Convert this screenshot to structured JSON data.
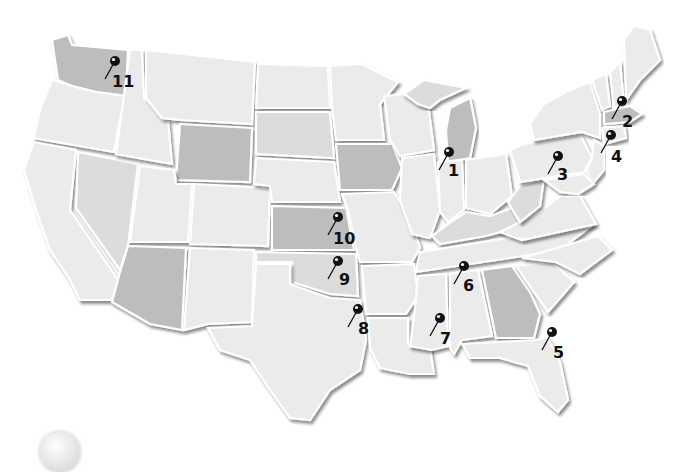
{
  "map": {
    "title": "United States map with numbered location pins",
    "style": "grayscale embossed states",
    "colors": {
      "background": "#ffffff",
      "state_light": "#ebebeb",
      "state_mid": "#dcdcdc",
      "state_dark": "#bdbdbd",
      "pin": "#111111",
      "label": "#111111"
    },
    "pins": [
      {
        "id": 1,
        "label": "1",
        "region": "Illinois / Lake Michigan",
        "x": 449,
        "y": 152,
        "lx": 448,
        "ly": 176
      },
      {
        "id": 2,
        "label": "2",
        "region": "Massachusetts",
        "x": 622,
        "y": 101,
        "lx": 622,
        "ly": 127
      },
      {
        "id": 3,
        "label": "3",
        "region": "Pennsylvania",
        "x": 558,
        "y": 156,
        "lx": 557,
        "ly": 180
      },
      {
        "id": 4,
        "label": "4",
        "region": "New Jersey",
        "x": 611,
        "y": 135,
        "lx": 611,
        "ly": 162
      },
      {
        "id": 5,
        "label": "5",
        "region": "Florida",
        "x": 552,
        "y": 332,
        "lx": 553,
        "ly": 358
      },
      {
        "id": 6,
        "label": "6",
        "region": "Tennessee",
        "x": 464,
        "y": 266,
        "lx": 463,
        "ly": 291
      },
      {
        "id": 7,
        "label": "7",
        "region": "Mississippi",
        "x": 440,
        "y": 318,
        "lx": 440,
        "ly": 344
      },
      {
        "id": 8,
        "label": "8",
        "region": "Texas (Dallas area)",
        "x": 358,
        "y": 309,
        "lx": 358,
        "ly": 334
      },
      {
        "id": 9,
        "label": "9",
        "region": "Oklahoma",
        "x": 338,
        "y": 261,
        "lx": 339,
        "ly": 285
      },
      {
        "id": 10,
        "label": "10",
        "region": "Kansas",
        "x": 338,
        "y": 217,
        "lx": 333,
        "ly": 244
      },
      {
        "id": 11,
        "label": "11",
        "region": "Washington",
        "x": 115,
        "y": 61,
        "lx": 112,
        "ly": 87
      }
    ],
    "shaded_states": [
      "Washington",
      "Wyoming",
      "Iowa",
      "Kansas",
      "Oklahoma",
      "Arizona",
      "Michigan",
      "Georgia",
      "Massachusetts"
    ]
  }
}
